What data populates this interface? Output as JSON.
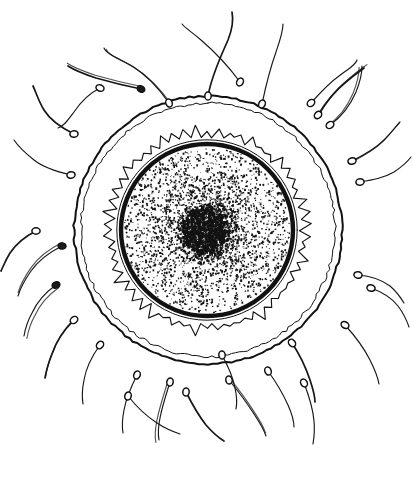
{
  "figure": {
    "style": "black-and-white pen-and-ink line drawing",
    "background_color": "#ffffff",
    "ink_color": "#121212",
    "canvas": {
      "width": 413,
      "height": 490
    }
  },
  "chart_data": {
    "type": "diagram",
    "xlabel": "",
    "ylabel": "",
    "structures": [
      {
        "name": "outer-membrane",
        "label": "Zona pellucida / outer membrane",
        "shape": "double concentric circle",
        "center": [
          208,
          230
        ],
        "radius_outer": 134,
        "radius_inner": 127,
        "stroke": "#121212"
      },
      {
        "name": "corona-radiata",
        "label": "Corona radiata",
        "shape": "jagged spiked ring",
        "center": [
          207,
          230
        ],
        "radius_outer": 107,
        "radius_inner": 92,
        "spike_count": 54,
        "stroke": "#121212"
      },
      {
        "name": "vitelline-membrane",
        "label": "Vitelline membrane",
        "shape": "thick dark circle with thin outer companion",
        "center": [
          207,
          230
        ],
        "radius": 86,
        "stroke": "#101010"
      },
      {
        "name": "cytoplasm",
        "label": "Cytoplasm (stippled)",
        "shape": "stipple field",
        "center": [
          207,
          230
        ],
        "radius": 83,
        "stipple_count": 2600
      },
      {
        "name": "nucleus",
        "label": "Nucleus / pronucleus",
        "shape": "dense stipple blob",
        "center": [
          206,
          231
        ],
        "radius": 30,
        "stipple_count": 900
      }
    ],
    "sperm_count": 30,
    "sperm": [
      {
        "hx": 208,
        "hy": 96,
        "angle": -90,
        "tail": "M 208 96 C 212 74 222 54 228 40 C 232 30 234 22 232 12"
      },
      {
        "hx": 169,
        "hy": 103,
        "angle": -110,
        "tail": "M 169 103 C 160 90 148 76 132 66 C 118 58 106 54 104 48"
      },
      {
        "hx": 240,
        "hy": 82,
        "angle": -60,
        "tail": "M 240 82 C 229 67 215 52 201 40 C 192 32 185 28 182 24"
      },
      {
        "hx": 262,
        "hy": 104,
        "angle": -65,
        "tail": "M 262 104 C 266 85 271 66 276 52 C 280 40 283 32 283 24"
      },
      {
        "hx": 141,
        "hy": 89,
        "angle": -150,
        "tail": "M 141 89 C 126 86 110 82 96 78 C 84 74 74 70 68 66"
      },
      {
        "hx": 100,
        "hy": 88,
        "angle": -160,
        "tail": "M 100 88 C 90 93 80 103 74 112 C 68 120 64 126 58 128"
      },
      {
        "hx": 311,
        "hy": 103,
        "angle": -40,
        "tail": "M 311 103 C 319 94 329 83 339 76 C 348 69 355 66 357 60"
      },
      {
        "hx": 330,
        "hy": 125,
        "angle": -35,
        "tail": "M 330 125 C 340 118 350 106 356 92 C 360 82 362 74 362 66"
      },
      {
        "hx": 74,
        "hy": 134,
        "angle": 175,
        "tail": "M 74 134 C 62 128 50 120 44 110 C 38 100 36 92 33 86"
      },
      {
        "hx": 71,
        "hy": 175,
        "angle": 170,
        "tail": "M 71 175 C 58 172 44 168 34 160 C 24 152 18 146 14 140"
      },
      {
        "hx": 352,
        "hy": 161,
        "angle": -15,
        "tail": "M 352 161 C 364 155 376 148 384 140 C 392 132 396 126 400 122"
      },
      {
        "hx": 360,
        "hy": 182,
        "angle": -5,
        "tail": "M 360 182 C 372 180 384 178 394 172 C 403 166 408 161 411 157"
      },
      {
        "hx": 36,
        "hy": 231,
        "angle": 180,
        "tail": "M 36 231 C 26 236 16 244 10 253 C 5 261 3 267 1 271"
      },
      {
        "hx": 62,
        "hy": 246,
        "angle": 185,
        "tail": "M 62 246 C 50 252 38 261 31 271 C 24 281 20 289 18 296"
      },
      {
        "hx": 358,
        "hy": 275,
        "angle": 10,
        "tail": "M 358 275 C 370 276 382 280 390 286 C 397 292 401 298 404 303"
      },
      {
        "hx": 371,
        "hy": 288,
        "angle": 15,
        "tail": "M 371 288 C 382 292 392 298 398 306 C 404 314 407 321 409 327"
      },
      {
        "hx": 74,
        "hy": 320,
        "angle": 140,
        "tail": "M 74 320 C 64 330 56 342 52 354 C 48 364 46 372 45 378"
      },
      {
        "hx": 100,
        "hy": 345,
        "angle": 130,
        "tail": "M 100 345 C 92 356 86 368 84 380 C 82 390 82 398 83 404"
      },
      {
        "hx": 137,
        "hy": 375,
        "angle": 110,
        "tail": "M 137 375 C 131 387 126 399 124 410 C 122 420 122 427 123 433"
      },
      {
        "hx": 170,
        "hy": 382,
        "angle": 100,
        "tail": "M 170 382 C 166 395 162 407 160 418 C 158 428 158 435 159 440"
      },
      {
        "hx": 292,
        "hy": 343,
        "angle": 50,
        "tail": "M 292 343 C 300 355 306 368 310 380 C 313 389 315 396 315 402"
      },
      {
        "hx": 268,
        "hy": 371,
        "angle": 70,
        "tail": "M 268 371 C 276 382 283 394 288 405 C 292 414 294 421 294 427"
      },
      {
        "hx": 56,
        "hy": 285,
        "angle": 160,
        "tail": "M 56 285 C 46 292 37 302 32 313 C 27 322 25 330 24 336"
      },
      {
        "hx": 128,
        "hy": 396,
        "angle": 105,
        "tail": "M 128 396 C 136 406 146 416 157 423 C 166 429 174 432 180 434"
      },
      {
        "hx": 186,
        "hy": 392,
        "angle": 95,
        "tail": "M 186 392 C 192 404 199 416 206 425 C 213 433 219 438 224 441"
      },
      {
        "hx": 229,
        "hy": 380,
        "angle": 80,
        "tail": "M 229 380 C 238 391 247 403 254 414 C 260 423 264 430 266 436"
      },
      {
        "hx": 304,
        "hy": 383,
        "angle": 60,
        "tail": "M 304 383 C 309 396 313 409 314 421 C 315 431 314 438 313 444"
      },
      {
        "hx": 345,
        "hy": 325,
        "angle": 30,
        "tail": "M 345 325 C 355 336 364 348 370 360 C 375 370 378 378 379 384"
      },
      {
        "hx": 318,
        "hy": 115,
        "angle": -45,
        "tail": "M 318 115 C 326 102 336 90 346 82 C 354 75 360 71 364 68"
      },
      {
        "hx": 222,
        "hy": 355,
        "angle": 85,
        "tail": "M 222 355 C 228 366 233 377 235 388 C 237 397 237 404 236 409"
      }
    ]
  }
}
